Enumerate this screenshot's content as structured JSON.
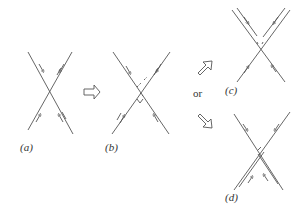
{
  "figure": {
    "line_color": "#555555",
    "arrow_outline_color": "#555555",
    "background": "#ffffff"
  },
  "panels": [
    {
      "id": "a",
      "label": "(a)",
      "description": "Two single strands crossing in an X with direction arrows"
    },
    {
      "id": "b",
      "label": "(b)",
      "description": "Two strands crossing with small dashed break marks at the crossing"
    },
    {
      "id": "c",
      "label": "(c)",
      "description": "Reconnected strands, upper pair doubled"
    },
    {
      "id": "d",
      "label": "(d)",
      "description": "Reconnected strands, lower pair doubled"
    }
  ],
  "transitions": {
    "a_to_b": "right-arrow",
    "b_to_c": "up-right-arrow",
    "b_to_d": "down-right-arrow",
    "or_label": "or"
  }
}
